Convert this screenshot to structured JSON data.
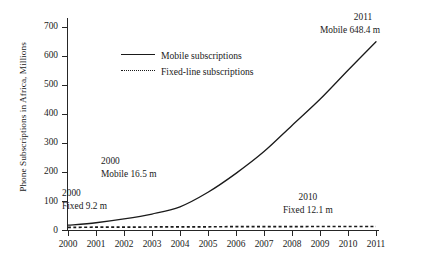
{
  "chart_data": {
    "type": "line",
    "title": "",
    "xlabel": "",
    "ylabel": "Phone Subscriptions in Africa, Millions",
    "xlim": [
      2000,
      2011
    ],
    "ylim": [
      0,
      730
    ],
    "grid": false,
    "legend_position": "upper-center-left",
    "x": [
      2000,
      2001,
      2002,
      2003,
      2004,
      2005,
      2006,
      2007,
      2008,
      2009,
      2010,
      2011
    ],
    "y_ticks": [
      0,
      100,
      200,
      300,
      400,
      500,
      600,
      700
    ],
    "x_ticks": [
      "2000",
      "2001",
      "2002",
      "2003",
      "2004",
      "2005",
      "2006",
      "2007",
      "2008",
      "2009",
      "2010",
      "2011"
    ],
    "series": [
      {
        "name": "Mobile subscriptions",
        "style": "solid",
        "color": "#1a1a1a",
        "values": [
          16.5,
          25.0,
          38.0,
          55.0,
          80.0,
          130.0,
          195.0,
          270.0,
          360.0,
          450.0,
          550.0,
          648.4
        ]
      },
      {
        "name": "Fixed-line subscriptions",
        "style": "dotted",
        "color": "#1a1a1a",
        "values": [
          9.2,
          9.6,
          10.0,
          10.4,
          10.8,
          11.1,
          11.4,
          11.7,
          11.9,
          12.0,
          12.1,
          12.1
        ]
      }
    ],
    "annotations": [
      {
        "id": "mobile-2011",
        "year": "2011",
        "value": "Mobile 648.4 m"
      },
      {
        "id": "mobile-2000",
        "year": "2000",
        "value": "Mobile 16.5 m"
      },
      {
        "id": "fixed-2000",
        "year": "2000",
        "value": "Fixed 9.2 m"
      },
      {
        "id": "fixed-2010",
        "year": "2010",
        "value": "Fixed 12.1 m"
      }
    ]
  },
  "legend": {
    "items": [
      {
        "label": "Mobile subscriptions"
      },
      {
        "label": "Fixed-line subscriptions"
      }
    ]
  }
}
